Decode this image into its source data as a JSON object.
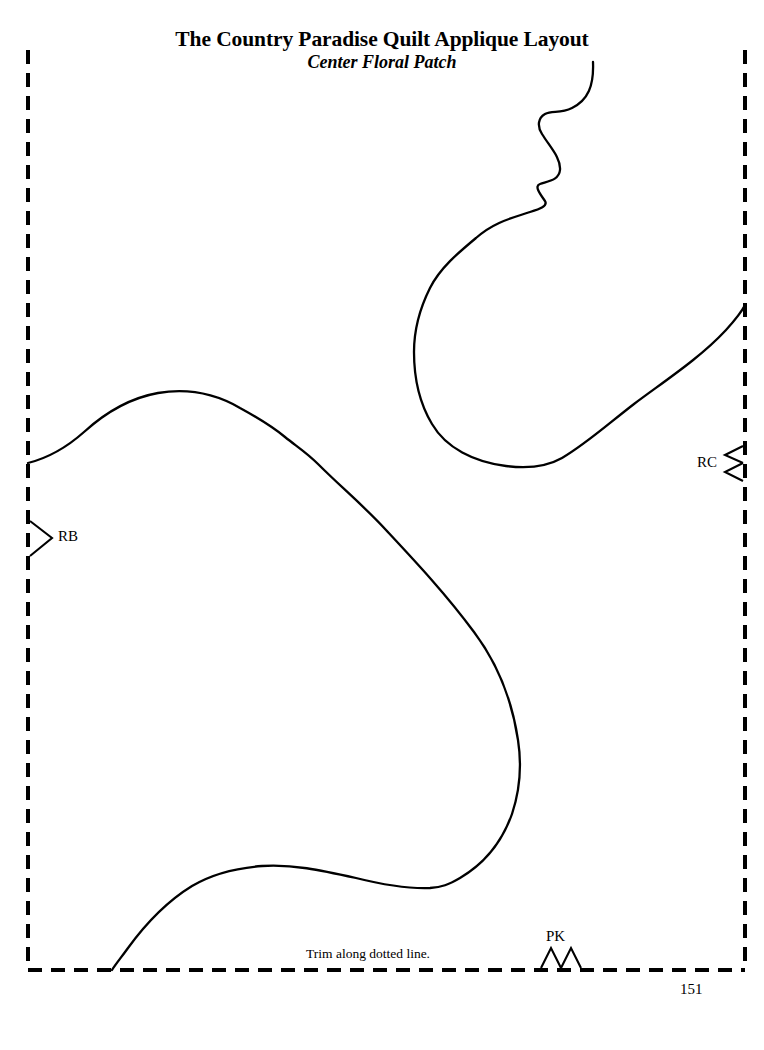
{
  "page": {
    "width": 764,
    "height": 1050,
    "background_color": "#ffffff",
    "ink_color": "#000000",
    "page_number": "151"
  },
  "header": {
    "title": "The Country Paradise Quilt Applique Layout",
    "subtitle": "Center Floral Patch"
  },
  "notes": {
    "trim_instruction": "Trim along dotted line."
  },
  "pattern": {
    "trim_border": {
      "style": "dashed",
      "left": 28,
      "top": 50,
      "right": 745,
      "bottom": 970,
      "dash_length": 14,
      "dash_gap": 9,
      "stroke_width": 4
    },
    "markers": [
      {
        "id": "rb",
        "label": "RB",
        "glyph": "single-chevron-right",
        "edge": "left",
        "x": 28,
        "y": 538,
        "notches": 1
      },
      {
        "id": "rc",
        "label": "RC",
        "glyph": "double-chevron-left",
        "edge": "right",
        "x": 745,
        "y": 463,
        "notches": 2
      },
      {
        "id": "pk",
        "label": "PK",
        "glyph": "double-chevron-up",
        "edge": "bottom",
        "x": 560,
        "y": 970,
        "notches": 2
      }
    ],
    "curves": [
      {
        "id": "upper-floral-lobe",
        "name": "upper floral petal outline",
        "start": [
          593,
          62
        ],
        "end": [
          745,
          305
        ],
        "path": "M 593 62 C 594 86 588 100 572 108 C 560 114 552 110 545 114 C 538 118 537 126 542 134 C 550 147 561 158 560 170 C 559 180 549 181 540 184 C 534 186 540 194 545 201 C 548 206 540 209 530 212 C 512 218 494 222 476 238 C 458 253 440 268 430 288 C 420 308 414 330 414 352 C 414 378 420 404 432 424 C 446 448 474 462 506 466 C 530 469 548 466 562 458 C 586 444 608 424 634 404 C 666 380 700 358 726 330 C 736 319 742 311 745 305"
      },
      {
        "id": "lower-large-lobe",
        "name": "large lower petal outline",
        "start": [
          28,
          463
        ],
        "end": [
          112,
          970
        ],
        "path": "M 28 463 C 48 458 66 448 84 432 C 106 412 130 398 158 393 C 188 388 216 394 240 408 C 262 420 274 428 285 437 C 296 446 306 452 318 464 C 342 488 364 506 386 530 C 414 560 446 594 474 632 C 498 664 512 700 518 740 C 522 766 520 790 512 814 C 502 842 484 864 460 878 C 448 885 442 887 430 888 C 404 889 380 884 356 878 C 320 870 292 864 262 866 C 236 868 212 874 192 886 C 166 902 144 926 128 948 C 120 959 115 965 112 970"
      }
    ]
  }
}
